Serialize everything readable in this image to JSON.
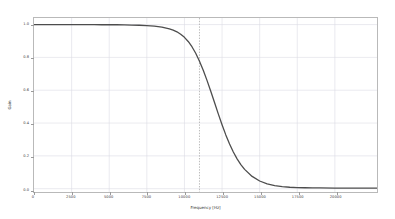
{
  "chart_data": {
    "type": "line",
    "title": "",
    "xlabel": "Frequency [Hz]",
    "ylabel": "Gain",
    "xlim": [
      0,
      22800
    ],
    "ylim": [
      -0.02,
      1.04
    ],
    "grid": true,
    "legend": null,
    "xticks": [
      0,
      2500,
      5000,
      7500,
      10000,
      12500,
      15000,
      17500,
      20000
    ],
    "xticklabels": [
      "0",
      "2500",
      "5000",
      "7500",
      "10000",
      "12500",
      "15000",
      "17500",
      "20000"
    ],
    "yticks": [
      0.0,
      0.2,
      0.4,
      0.6,
      0.8,
      1.0
    ],
    "yticklabels": [
      "0.0",
      "0.2",
      "0.4",
      "0.6",
      "0.8",
      "1.0"
    ],
    "series": [
      {
        "name": "Gain",
        "color": "#4d4d4d",
        "linewidth": 1.3,
        "x": [
          0,
          500,
          1000,
          1500,
          2000,
          2500,
          3000,
          3500,
          4000,
          4500,
          5000,
          5500,
          6000,
          6500,
          7000,
          7500,
          8000,
          8500,
          9000,
          9250,
          9500,
          9750,
          10000,
          10250,
          10500,
          10750,
          11000,
          11250,
          11500,
          11750,
          12000,
          12250,
          12500,
          12750,
          13000,
          13250,
          13500,
          13750,
          14000,
          14500,
          15000,
          15500,
          16000,
          16500,
          17000,
          17500,
          18000,
          18500,
          19000,
          20000,
          21000,
          22000,
          22800
        ],
        "y": [
          1.0,
          1.0,
          1.0,
          1.0,
          1.0,
          1.0,
          1.0,
          1.0,
          1.0,
          0.999,
          0.999,
          0.999,
          0.998,
          0.997,
          0.996,
          0.994,
          0.99,
          0.984,
          0.974,
          0.966,
          0.956,
          0.941,
          0.922,
          0.897,
          0.865,
          0.825,
          0.777,
          0.722,
          0.66,
          0.594,
          0.525,
          0.456,
          0.39,
          0.328,
          0.273,
          0.224,
          0.182,
          0.147,
          0.118,
          0.075,
          0.047,
          0.03,
          0.019,
          0.013,
          0.009,
          0.007,
          0.006,
          0.005,
          0.005,
          0.004,
          0.004,
          0.004,
          0.004
        ]
      }
    ],
    "annotations": [
      {
        "type": "vline",
        "name": "cutoff-marker",
        "x": 11000,
        "style": "dotted",
        "color": "#aaaaaa",
        "linewidth": 0.8
      }
    ]
  }
}
